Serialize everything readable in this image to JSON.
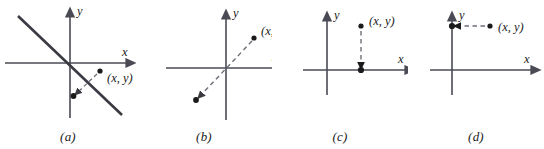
{
  "figure": {
    "type": "diagram",
    "background_color": "#ffffff",
    "ink_color": "#1a1a1a",
    "axis_color": "#4a4a55",
    "dash_color": "#6e6e78",
    "panels": [
      {
        "id": "a",
        "caption": "(a)",
        "x_axis_label": "x",
        "y_axis_label": "y",
        "point_label": "(x, y)",
        "origin": {
          "x": 70,
          "y": 63
        },
        "x_axis": {
          "x1": 5,
          "y1": 63,
          "x2": 133,
          "y2": 63
        },
        "y_axis": {
          "x1": 70,
          "y1": 118,
          "x2": 70,
          "y2": 10
        },
        "x_label_pos": {
          "x": 122,
          "y": 56
        },
        "y_label_pos": {
          "x": 77,
          "y": 14
        },
        "solid_line": {
          "x1": 18,
          "y1": 16,
          "x2": 122,
          "y2": 115
        },
        "point": {
          "x": 100,
          "y": 71
        },
        "point_label_pos": {
          "x": 107,
          "y": 82
        },
        "image_point": {
          "x": 73,
          "y": 96
        },
        "arrow": {
          "x1": 97,
          "y1": 74,
          "x2": 76,
          "y2": 93
        },
        "style": "solid mirror line with dashed arrow to reflected point"
      },
      {
        "id": "b",
        "caption": "(b)",
        "x_axis_label": "x",
        "y_axis_label": "y",
        "point_label": "(x, y)",
        "origin": {
          "x": 226,
          "y": 68
        },
        "x_axis": {
          "x1": 166,
          "y1": 68,
          "x2": 283,
          "y2": 68
        },
        "y_axis": {
          "x1": 226,
          "y1": 120,
          "x2": 226,
          "y2": 12
        },
        "x_label_pos": {
          "x": 272,
          "y": 61
        },
        "y_label_pos": {
          "x": 233,
          "y": 16
        },
        "point": {
          "x": 254,
          "y": 38
        },
        "point_label_pos": {
          "x": 261,
          "y": 35
        },
        "image_point": {
          "x": 196,
          "y": 100
        },
        "arrow": {
          "x1": 252,
          "y1": 41,
          "x2": 199,
          "y2": 97
        },
        "style": "dashed arrow through origin to point reflected in origin"
      },
      {
        "id": "c",
        "caption": "(c)",
        "x_axis_label": "x",
        "y_axis_label": "y",
        "point_label": "(x, y)",
        "origin": {
          "x": 327,
          "y": 70
        },
        "x_axis": {
          "x1": 303,
          "y1": 70,
          "x2": 412,
          "y2": 70
        },
        "y_axis": {
          "x1": 327,
          "y1": 95,
          "x2": 327,
          "y2": 14
        },
        "x_label_pos": {
          "x": 400,
          "y": 63
        },
        "y_label_pos": {
          "x": 334,
          "y": 18
        },
        "point": {
          "x": 361,
          "y": 26
        },
        "point_label_pos": {
          "x": 369,
          "y": 25
        },
        "image_point": {
          "x": 361,
          "y": 70
        },
        "arrow": {
          "x1": 361,
          "y1": 30,
          "x2": 361,
          "y2": 67
        },
        "style": "vertical dashed arrow down onto the x-axis"
      },
      {
        "id": "d",
        "caption": "(d)",
        "x_axis_label": "x",
        "y_axis_label": "y",
        "point_label": "(x, y)",
        "origin": {
          "x": 452,
          "y": 70
        },
        "x_axis": {
          "x1": 430,
          "y1": 70,
          "x2": 538,
          "y2": 70
        },
        "y_axis": {
          "x1": 452,
          "y1": 95,
          "x2": 452,
          "y2": 14
        },
        "x_label_pos": {
          "x": 526,
          "y": 63
        },
        "y_label_pos": {
          "x": 459,
          "y": 18
        },
        "point": {
          "x": 490,
          "y": 26
        },
        "point_label_pos": {
          "x": 498,
          "y": 31
        },
        "image_point": {
          "x": 452,
          "y": 26
        },
        "arrow": {
          "x1": 486,
          "y1": 26,
          "x2": 456,
          "y2": 26
        },
        "style": "horizontal dashed arrow left onto the y-axis"
      }
    ]
  }
}
